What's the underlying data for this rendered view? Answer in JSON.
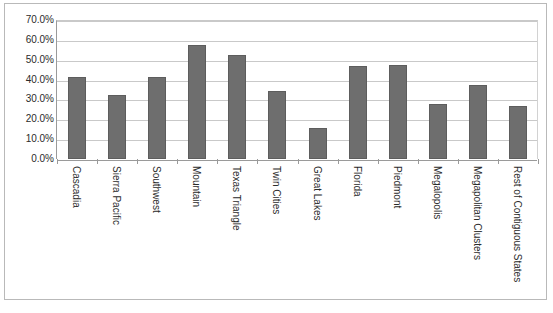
{
  "chart_data": {
    "type": "bar",
    "title": "",
    "xlabel": "",
    "ylabel": "",
    "ylim": [
      0,
      0.7
    ],
    "grid": true,
    "legend": false,
    "y_tick_labels": [
      "70.0%",
      "60.0%",
      "50.0%",
      "40.0%",
      "30.0%",
      "20.0%",
      "10.0%",
      "0.0%"
    ],
    "y_tick_values": [
      0.7,
      0.6,
      0.5,
      0.4,
      0.3,
      0.2,
      0.1,
      0.0
    ],
    "categories": [
      "Cascadia",
      "Sierra Pacific",
      "Southwest",
      "Mountain",
      "Texas Triangle",
      "Twin Cities",
      "Great Lakes",
      "Florida",
      "Piedmont",
      "Megalopolis",
      "Megapolitan Clusters",
      "Rest of Contiguous States"
    ],
    "values": [
      0.415,
      0.322,
      0.415,
      0.575,
      0.525,
      0.345,
      0.155,
      0.468,
      0.472,
      0.275,
      0.372,
      0.265
    ],
    "value_labels": [
      "41.5%",
      "32.2%",
      "41.5%",
      "57.5%",
      "52.5%",
      "34.5%",
      "15.5%",
      "46.8%",
      "47.2%",
      "27.5%",
      "37.2%",
      "26.5%"
    ],
    "bar_color": "#6e6e6e",
    "bar_border_color": "#5d5d5d",
    "gridline_color": "#c9c9c9",
    "axis_color": "#9a9a9a",
    "frame_border_color": "#b9b9b9",
    "background_color": "#ffffff",
    "text_color": "#2b2b2b"
  }
}
